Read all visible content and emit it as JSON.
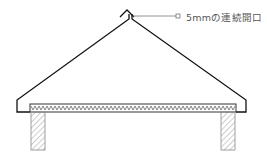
{
  "diagram": {
    "type": "roof-section",
    "annotation": {
      "text": "5mmの連続開口",
      "target": "ridge-vent"
    },
    "elements": [
      "ridge-cap",
      "roof-left-slope",
      "roof-right-slope",
      "left-eave",
      "right-eave",
      "ceiling-insulation",
      "left-post",
      "right-post"
    ],
    "colors": {
      "line": "#111111",
      "leader": "#777777",
      "hatch": "#999999",
      "text": "#555555"
    }
  }
}
